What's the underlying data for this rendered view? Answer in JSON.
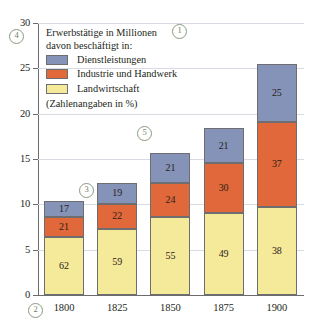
{
  "chart_data": {
    "type": "bar",
    "subtype": "stacked-bar",
    "title": "Erwerbstätige in Millionen",
    "subtitle": "davon beschäftigt in:",
    "note": "(Zahlenangaben in %)",
    "xlabel": "",
    "ylabel": "",
    "categories": [
      "1800",
      "1825",
      "1850",
      "1875",
      "1900"
    ],
    "ylim": [
      0,
      30
    ],
    "yticks": [
      "0",
      "5",
      "10",
      "15",
      "20",
      "25",
      "30"
    ],
    "ytick_values": [
      0,
      5,
      10,
      15,
      20,
      25,
      30
    ],
    "grid": true,
    "legend_position": "inside-top-left",
    "totals_millions": [
      10.4,
      12.4,
      15.7,
      18.4,
      25.5
    ],
    "series": [
      {
        "name": "Landwirtschaft",
        "color": "#f5e99a",
        "values": [
          62,
          59,
          55,
          49,
          38
        ]
      },
      {
        "name": "Industrie und Handwerk",
        "color": "#e0683a",
        "values": [
          21,
          22,
          24,
          30,
          37
        ]
      },
      {
        "name": "Dienstleistungen",
        "color": "#8593b8",
        "values": [
          17,
          19,
          21,
          21,
          25
        ]
      }
    ]
  },
  "legend": {
    "title": "Erwerbstätige in Millionen",
    "subtitle": "davon beschäftigt in:",
    "note": "(Zahlenangaben in %)",
    "items": [
      {
        "label": "Dienstleistungen",
        "color": "#8593b8"
      },
      {
        "label": "Industrie und Handwerk",
        "color": "#e0683a"
      },
      {
        "label": "Landwirtschaft",
        "color": "#f5e99a"
      }
    ]
  },
  "markers": [
    {
      "label": "①",
      "x": 172,
      "y": 24
    },
    {
      "label": "②",
      "x": 28,
      "y": 303
    },
    {
      "label": "③",
      "x": 79,
      "y": 183
    },
    {
      "label": "④",
      "x": 9,
      "y": 29
    },
    {
      "label": "⑤",
      "x": 137,
      "y": 126
    }
  ],
  "colors": {
    "services": "#8593b8",
    "industry": "#e0683a",
    "agriculture": "#f5e99a",
    "grid": "#d8dbe4",
    "axis": "#6b6b6b",
    "bar_outline": "#6e6e70",
    "marker": "#8a9a7e",
    "background": "#ffffff"
  }
}
